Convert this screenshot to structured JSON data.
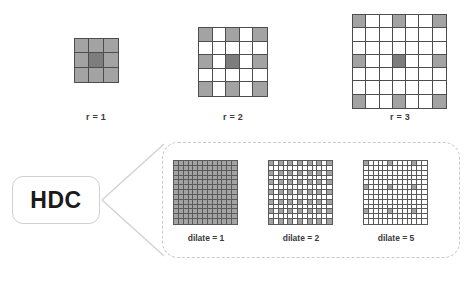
{
  "figure": {
    "title_text": "",
    "colors": {
      "cell_on": "#a3a3a3",
      "cell_core": "#7d7d7d",
      "cell_off": "#ffffff",
      "grid_line": "#4d4d4d",
      "panel_border": "#c9c9c9",
      "hdc_border": "#d0d0d0",
      "text": "#3a3a3a"
    }
  },
  "top_row": {
    "kernels": [
      {
        "label": "r = 1",
        "size": 3,
        "dilation": 1,
        "active_cells": [
          [
            0,
            0
          ],
          [
            0,
            1
          ],
          [
            0,
            2
          ],
          [
            1,
            0
          ],
          [
            1,
            1
          ],
          [
            1,
            2
          ],
          [
            2,
            0
          ],
          [
            2,
            1
          ],
          [
            2,
            2
          ]
        ],
        "core_cell": [
          1,
          1
        ]
      },
      {
        "label": "r = 2",
        "size": 5,
        "dilation": 2,
        "active_cells": [
          [
            0,
            0
          ],
          [
            0,
            2
          ],
          [
            0,
            4
          ],
          [
            2,
            0
          ],
          [
            2,
            2
          ],
          [
            2,
            4
          ],
          [
            4,
            0
          ],
          [
            4,
            2
          ],
          [
            4,
            4
          ]
        ],
        "core_cell": [
          2,
          2
        ]
      },
      {
        "label": "r = 3",
        "size": 7,
        "dilation": 3,
        "active_cells": [
          [
            0,
            0
          ],
          [
            0,
            3
          ],
          [
            0,
            6
          ],
          [
            3,
            0
          ],
          [
            3,
            3
          ],
          [
            3,
            6
          ],
          [
            6,
            0
          ],
          [
            6,
            3
          ],
          [
            6,
            6
          ]
        ],
        "core_cell": [
          3,
          3
        ]
      }
    ]
  },
  "hdc": {
    "box_label": "HDC",
    "panel": {
      "grids": [
        {
          "label": "dilate = 1",
          "size": 13,
          "dilation": 1,
          "pattern": "full"
        },
        {
          "label": "dilate = 2",
          "size": 13,
          "dilation": 2,
          "pattern": "stride"
        },
        {
          "label": "dilate = 5",
          "size": 13,
          "dilation": 5,
          "pattern": "stride"
        }
      ]
    }
  },
  "chart_data": {
    "type": "heatmap",
    "xlabel": "",
    "ylabel": "",
    "grid": true,
    "legend": "none",
    "panels": [
      {
        "name": "r = 1",
        "rows": 3,
        "cols": 5,
        "dilation": 1,
        "active_count": 9
      },
      {
        "name": "r = 2",
        "rows": 5,
        "cols": 5,
        "dilation": 2,
        "active_count": 9
      },
      {
        "name": "r = 3",
        "rows": 7,
        "cols": 7,
        "dilation": 3,
        "active_count": 9
      },
      {
        "name": "dilate = 1",
        "rows": 13,
        "cols": 13,
        "dilation": 1,
        "active_count": 169
      },
      {
        "name": "dilate = 2",
        "rows": 13,
        "cols": 13,
        "dilation": 2,
        "active_count": 49
      },
      {
        "name": "dilate = 5",
        "rows": 13,
        "cols": 13,
        "dilation": 5,
        "active_count": 9
      }
    ]
  }
}
